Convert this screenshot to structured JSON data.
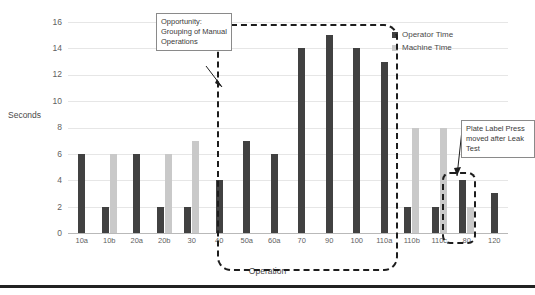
{
  "chart_data": {
    "type": "bar",
    "title": "",
    "xlabel": "Operation",
    "ylabel": "Seconds",
    "ylim": [
      0,
      16
    ],
    "yticks": [
      0,
      2,
      4,
      6,
      8,
      10,
      12,
      14,
      16
    ],
    "grid": true,
    "legend_position": "top-right",
    "categories": [
      "10a",
      "10b",
      "20a",
      "20b",
      "30",
      "40",
      "50a",
      "60a",
      "70",
      "90",
      "100",
      "110a",
      "110b",
      "110c",
      "80",
      "120"
    ],
    "series": [
      {
        "name": "Operator Time",
        "color": "#414141",
        "values": [
          6,
          2,
          6,
          2,
          2,
          4,
          7,
          6,
          14,
          15,
          14,
          13,
          2,
          2,
          4,
          3
        ]
      },
      {
        "name": "Machine Time",
        "color": "#c9c9c9",
        "values": [
          0,
          6,
          0,
          6,
          7,
          0,
          0,
          0,
          0,
          0,
          0,
          0,
          8,
          8,
          2,
          0
        ]
      }
    ],
    "annotations": [
      {
        "text": "Opportunity: Grouping of Manual Operations",
        "points_to": "50a"
      },
      {
        "text": "Plate Label Press moved after Leak Test",
        "points_to": "80"
      }
    ],
    "highlight_regions": [
      {
        "name": "manual-operations-group",
        "from": "50a",
        "to": "110a"
      },
      {
        "name": "plate-label-press-group",
        "from": "80",
        "to": "80"
      }
    ]
  },
  "legend": {
    "items": [
      {
        "label": "Operator Time"
      },
      {
        "label": "Machine Time"
      }
    ]
  },
  "axes": {
    "y_title": "Seconds",
    "x_title": "Operation",
    "y_ticks": [
      "16",
      "14",
      "12",
      "10",
      "8",
      "6",
      "4",
      "2",
      "0"
    ]
  },
  "callouts": {
    "grouping": "Opportunity: Grouping of Manual Operations",
    "plate": "Plate Label Press moved after Leak Test"
  }
}
